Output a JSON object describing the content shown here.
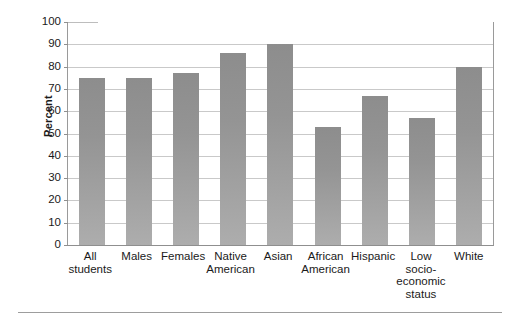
{
  "chart_data": {
    "type": "bar",
    "title": "",
    "xlabel": "",
    "ylabel": "Percent",
    "ylim": [
      0,
      100
    ],
    "ytick_step": 10,
    "grid": true,
    "legend": "none",
    "bar_color": "#9a9a9a",
    "categories": [
      "All students",
      "Males",
      "Females",
      "Native American",
      "Asian",
      "African American",
      "Hispanic",
      "Low socio-economic status",
      "White"
    ],
    "category_lines": [
      "All\nstudents",
      "Males",
      "Females",
      "Native\nAmerican",
      "Asian",
      "African\nAmerican",
      "Hispanic",
      "Low\nsocio-\neconomic\nstatus",
      "White"
    ],
    "values": [
      75,
      75,
      77,
      86,
      90,
      53,
      67,
      57,
      80
    ],
    "yticks": [
      0,
      10,
      20,
      30,
      40,
      50,
      60,
      70,
      80,
      90,
      100
    ],
    "ytick_labels": [
      "0",
      "10",
      "20",
      "30",
      "40",
      "50",
      "60",
      "70",
      "80",
      "90",
      "100"
    ]
  }
}
